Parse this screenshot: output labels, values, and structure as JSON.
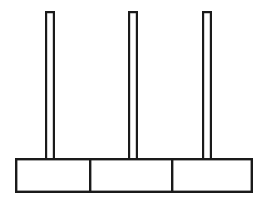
{
  "diagram": {
    "title": "Three empty pegs mounted on a segmented base",
    "type": "line-drawing",
    "canvas": {
      "width": 269,
      "height": 206,
      "background": "#ffffff"
    },
    "colors": {
      "stroke": "#1a1a1a",
      "fill": "#ffffff",
      "background": "#ffffff"
    },
    "base": {
      "label": "base",
      "x": 15,
      "y": 158,
      "width": 238,
      "height": 35,
      "segment_count": 3,
      "divider_x_positions": [
        89,
        171
      ],
      "segments": [
        {
          "label": "base-segment-left",
          "x": 15,
          "width": 74
        },
        {
          "label": "base-segment-middle",
          "x": 89,
          "width": 82
        },
        {
          "label": "base-segment-right",
          "x": 171,
          "width": 82
        }
      ]
    },
    "pegs": [
      {
        "label": "peg-left",
        "x": 45,
        "y": 11,
        "width": 10,
        "height": 148,
        "disc_count": 0
      },
      {
        "label": "peg-middle",
        "x": 128,
        "y": 11,
        "width": 10,
        "height": 148,
        "disc_count": 0
      },
      {
        "label": "peg-right",
        "x": 202,
        "y": 11,
        "width": 10,
        "height": 148,
        "disc_count": 0
      }
    ],
    "discs": []
  }
}
